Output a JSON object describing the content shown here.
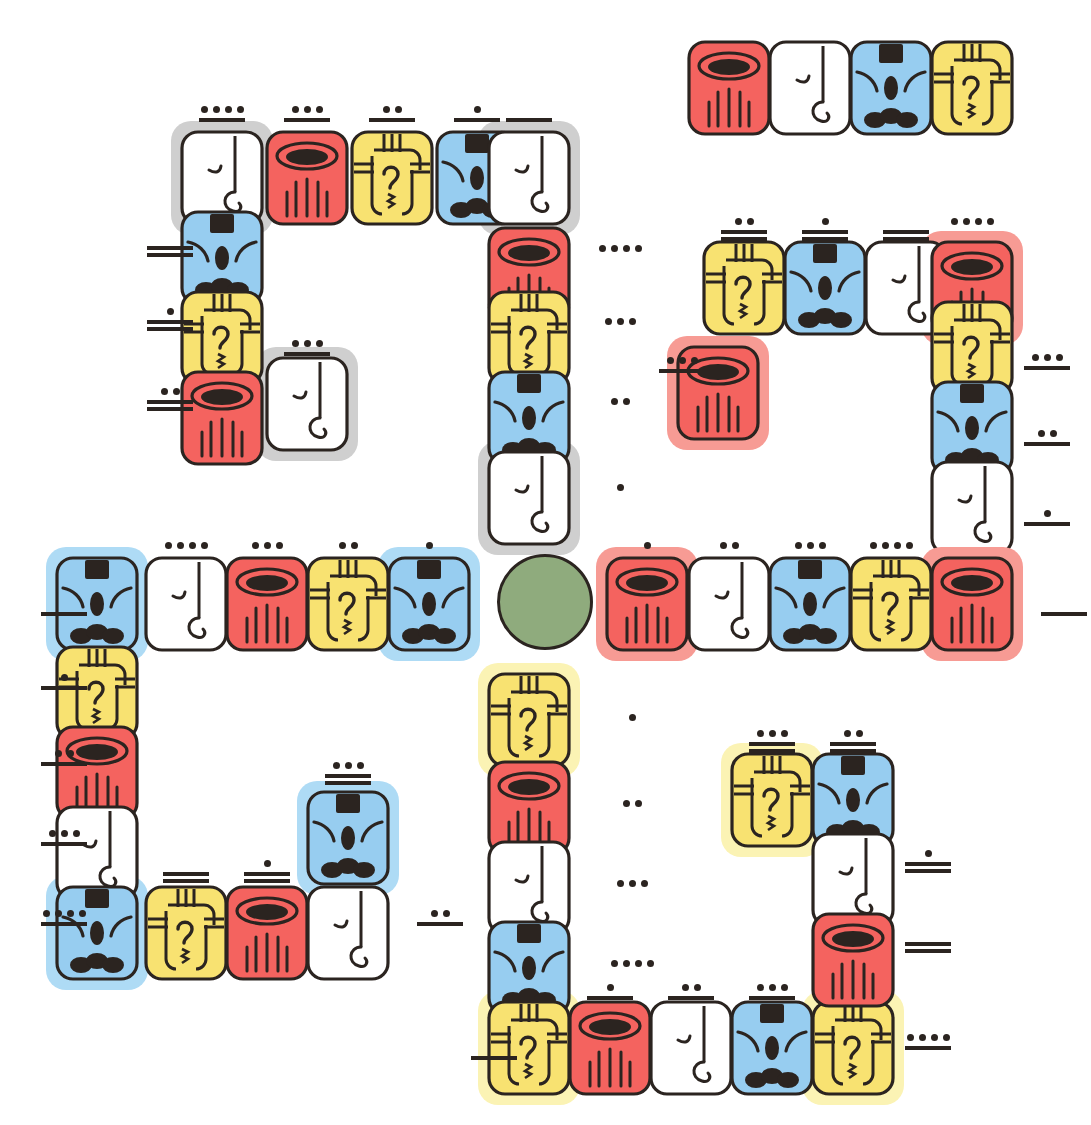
{
  "meta": {
    "canvas": {
      "width": 1067,
      "height": 1125
    },
    "background": "#ffffff"
  },
  "palette": {
    "red": "#f4635f",
    "red_halo": "#f79b94",
    "yellow": "#f8e271",
    "yellow_halo": "#fbf3b4",
    "blue": "#97cdf0",
    "blue_halo": "#aedbf5",
    "white": "#ffffff",
    "gray_halo": "#cfcfcf",
    "ink": "#2b2420",
    "green_circle": "#8fab7d"
  },
  "glyph_types": {
    "red": {
      "name": "red-bowl-glyph",
      "label": "red bowl with strokes"
    },
    "white": {
      "name": "white-hook-glyph",
      "label": "white hook"
    },
    "blue": {
      "name": "blue-face-glyph",
      "label": "blue face with dark crown"
    },
    "yellow": {
      "name": "yellow-spiral-glyph",
      "label": "yellow spiral scroll"
    }
  },
  "numerals": {
    "system": "maya-bar-and-dot",
    "dot_value": 1,
    "bar_value": 5
  },
  "separator": {
    "name": "green-circle-separator",
    "color": "#8fab7d",
    "cx": 545,
    "cy": 602,
    "r": 48
  },
  "groups": [
    {
      "id": "top-left-block",
      "name": "glyph-group-top-left",
      "cards": [
        {
          "id": "tl-r0c0",
          "type": "white",
          "x": 180,
          "y": 130,
          "halo": "gray"
        },
        {
          "id": "tl-r0c1",
          "type": "red",
          "x": 265,
          "y": 130,
          "halo": null
        },
        {
          "id": "tl-r0c2",
          "type": "yellow",
          "x": 350,
          "y": 130,
          "halo": null
        },
        {
          "id": "tl-r0c3",
          "type": "blue",
          "x": 435,
          "y": 130,
          "halo": null
        },
        {
          "id": "tl-r0c4",
          "type": "white",
          "x": 487,
          "y": 130,
          "halo": "gray"
        },
        {
          "id": "tl-c0r1",
          "type": "blue",
          "x": 180,
          "y": 210,
          "halo": null
        },
        {
          "id": "tl-c0r2",
          "type": "yellow",
          "x": 180,
          "y": 290,
          "halo": null
        },
        {
          "id": "tl-c0r3",
          "type": "red",
          "x": 180,
          "y": 370,
          "halo": null
        },
        {
          "id": "tl-r3c1",
          "type": "white",
          "x": 265,
          "y": 356,
          "halo": "gray"
        },
        {
          "id": "tl-c4r1",
          "type": "red",
          "x": 487,
          "y": 226,
          "halo": null
        },
        {
          "id": "tl-c4r2",
          "type": "yellow",
          "x": 487,
          "y": 290,
          "halo": null
        },
        {
          "id": "tl-c4r3",
          "type": "blue",
          "x": 487,
          "y": 370,
          "halo": null
        },
        {
          "id": "tl-c4r4",
          "type": "white",
          "x": 487,
          "y": 450,
          "halo": "gray"
        }
      ],
      "numerals": [
        {
          "id": "tl-n-top0",
          "dots": 4,
          "bars": 1,
          "x": 180,
          "y": 104,
          "anchor": "top"
        },
        {
          "id": "tl-n-top1",
          "dots": 3,
          "bars": 1,
          "x": 265,
          "y": 104,
          "anchor": "top"
        },
        {
          "id": "tl-n-top2",
          "dots": 2,
          "bars": 1,
          "x": 350,
          "y": 104,
          "anchor": "top"
        },
        {
          "id": "tl-n-top3",
          "dots": 1,
          "bars": 1,
          "x": 435,
          "y": 104,
          "anchor": "top"
        },
        {
          "id": "tl-n-top4",
          "dots": 0,
          "bars": 1,
          "x": 487,
          "y": 104,
          "anchor": "top"
        },
        {
          "id": "tl-n-left1",
          "dots": 0,
          "bars": 2,
          "x": 128,
          "y": 232,
          "anchor": "left"
        },
        {
          "id": "tl-n-left2",
          "dots": 1,
          "bars": 2,
          "x": 128,
          "y": 306,
          "anchor": "left"
        },
        {
          "id": "tl-n-left3",
          "dots": 2,
          "bars": 2,
          "x": 128,
          "y": 386,
          "anchor": "left"
        },
        {
          "id": "tl-n-in3",
          "dots": 3,
          "bars": 1,
          "x": 265,
          "y": 338,
          "anchor": "top"
        },
        {
          "id": "tl-n-right1",
          "dots": 4,
          "bars": 0,
          "x": 578,
          "y": 243,
          "anchor": "right"
        },
        {
          "id": "tl-n-right2",
          "dots": 3,
          "bars": 0,
          "x": 578,
          "y": 316,
          "anchor": "right"
        },
        {
          "id": "tl-n-right3",
          "dots": 2,
          "bars": 0,
          "x": 578,
          "y": 396,
          "anchor": "right"
        },
        {
          "id": "tl-n-right4",
          "dots": 1,
          "bars": 0,
          "x": 578,
          "y": 482,
          "anchor": "right"
        }
      ]
    },
    {
      "id": "top-right-strip",
      "name": "glyph-group-top-right-strip",
      "cards": [
        {
          "id": "trs-0",
          "type": "red",
          "x": 687,
          "y": 40,
          "halo": null
        },
        {
          "id": "trs-1",
          "type": "white",
          "x": 768,
          "y": 40,
          "halo": null
        },
        {
          "id": "trs-2",
          "type": "blue",
          "x": 849,
          "y": 40,
          "halo": null
        },
        {
          "id": "trs-3",
          "type": "yellow",
          "x": 930,
          "y": 40,
          "halo": null
        }
      ],
      "numerals": []
    },
    {
      "id": "mid-right-block",
      "name": "glyph-group-mid-right",
      "cards": [
        {
          "id": "mr-r0c0",
          "type": "yellow",
          "x": 702,
          "y": 240,
          "halo": null
        },
        {
          "id": "mr-r0c1",
          "type": "blue",
          "x": 783,
          "y": 240,
          "halo": null
        },
        {
          "id": "mr-r0c2",
          "type": "white",
          "x": 864,
          "y": 240,
          "halo": null
        },
        {
          "id": "mr-r0c3",
          "type": "red",
          "x": 930,
          "y": 240,
          "halo": "red"
        },
        {
          "id": "mr-c0r1",
          "type": "red",
          "x": 676,
          "y": 345,
          "halo": "red"
        },
        {
          "id": "mr-c3r1",
          "type": "yellow",
          "x": 930,
          "y": 300,
          "halo": null
        },
        {
          "id": "mr-c3r2",
          "type": "blue",
          "x": 930,
          "y": 380,
          "halo": null
        },
        {
          "id": "mr-c3r3",
          "type": "white",
          "x": 930,
          "y": 460,
          "halo": null
        }
      ],
      "numerals": [
        {
          "id": "mr-n-top0",
          "dots": 2,
          "bars": 2,
          "x": 702,
          "y": 216,
          "anchor": "top"
        },
        {
          "id": "mr-n-top1",
          "dots": 1,
          "bars": 2,
          "x": 783,
          "y": 216,
          "anchor": "top"
        },
        {
          "id": "mr-n-top2",
          "dots": 0,
          "bars": 2,
          "x": 864,
          "y": 216,
          "anchor": "top"
        },
        {
          "id": "mr-n-top3",
          "dots": 4,
          "bars": 0,
          "x": 930,
          "y": 216,
          "anchor": "top"
        },
        {
          "id": "mr-n-left1",
          "dots": 3,
          "bars": 1,
          "x": 640,
          "y": 355,
          "anchor": "left"
        },
        {
          "id": "mr-n-right1",
          "dots": 3,
          "bars": 1,
          "x": 1005,
          "y": 352,
          "anchor": "right"
        },
        {
          "id": "mr-n-right2",
          "dots": 2,
          "bars": 1,
          "x": 1005,
          "y": 428,
          "anchor": "right"
        },
        {
          "id": "mr-n-right3",
          "dots": 1,
          "bars": 1,
          "x": 1005,
          "y": 508,
          "anchor": "right"
        }
      ]
    },
    {
      "id": "mid-left-right-row",
      "name": "glyph-group-center-row",
      "cards": [
        {
          "id": "cl-0",
          "type": "blue",
          "x": 55,
          "y": 556,
          "halo": "blue"
        },
        {
          "id": "cl-1",
          "type": "white",
          "x": 144,
          "y": 556,
          "halo": null
        },
        {
          "id": "cl-2",
          "type": "red",
          "x": 225,
          "y": 556,
          "halo": null
        },
        {
          "id": "cl-3",
          "type": "yellow",
          "x": 306,
          "y": 556,
          "halo": null
        },
        {
          "id": "cl-4",
          "type": "blue",
          "x": 387,
          "y": 556,
          "halo": "blue"
        },
        {
          "id": "cr-0",
          "type": "red",
          "x": 605,
          "y": 556,
          "halo": "red"
        },
        {
          "id": "cr-1",
          "type": "white",
          "x": 687,
          "y": 556,
          "halo": null
        },
        {
          "id": "cr-2",
          "type": "blue",
          "x": 768,
          "y": 556,
          "halo": null
        },
        {
          "id": "cr-3",
          "type": "yellow",
          "x": 849,
          "y": 556,
          "halo": null
        },
        {
          "id": "cr-4",
          "type": "red",
          "x": 930,
          "y": 556,
          "halo": "red"
        }
      ],
      "numerals": [
        {
          "id": "cl-n-top1",
          "dots": 4,
          "bars": 0,
          "x": 144,
          "y": 540,
          "anchor": "top"
        },
        {
          "id": "cl-n-top2",
          "dots": 3,
          "bars": 0,
          "x": 225,
          "y": 540,
          "anchor": "top"
        },
        {
          "id": "cl-n-top3",
          "dots": 2,
          "bars": 0,
          "x": 306,
          "y": 540,
          "anchor": "top"
        },
        {
          "id": "cl-n-top4",
          "dots": 1,
          "bars": 0,
          "x": 387,
          "y": 540,
          "anchor": "top"
        },
        {
          "id": "cl-n-left0",
          "dots": 0,
          "bars": 1,
          "x": 22,
          "y": 598,
          "anchor": "left"
        },
        {
          "id": "cr-n-top0",
          "dots": 1,
          "bars": 0,
          "x": 605,
          "y": 540,
          "anchor": "top"
        },
        {
          "id": "cr-n-top1",
          "dots": 2,
          "bars": 0,
          "x": 687,
          "y": 540,
          "anchor": "top"
        },
        {
          "id": "cr-n-top2",
          "dots": 3,
          "bars": 0,
          "x": 768,
          "y": 540,
          "anchor": "top"
        },
        {
          "id": "cr-n-top3",
          "dots": 4,
          "bars": 0,
          "x": 849,
          "y": 540,
          "anchor": "top"
        },
        {
          "id": "cr-n-right4",
          "dots": 0,
          "bars": 1,
          "x": 1022,
          "y": 598,
          "anchor": "right"
        }
      ]
    },
    {
      "id": "bottom-left-block",
      "name": "glyph-group-bottom-left",
      "cards": [
        {
          "id": "bl-c0r1",
          "type": "yellow",
          "x": 55,
          "y": 645,
          "halo": null
        },
        {
          "id": "bl-c0r2",
          "type": "red",
          "x": 55,
          "y": 725,
          "halo": null
        },
        {
          "id": "bl-c0r3",
          "type": "white",
          "x": 55,
          "y": 805,
          "halo": null
        },
        {
          "id": "bl-c0r4",
          "type": "blue",
          "x": 55,
          "y": 885,
          "halo": "blue"
        },
        {
          "id": "bl-r4c1",
          "type": "yellow",
          "x": 144,
          "y": 885,
          "halo": null
        },
        {
          "id": "bl-r4c2",
          "type": "red",
          "x": 225,
          "y": 885,
          "halo": null
        },
        {
          "id": "bl-r4c3",
          "type": "white",
          "x": 306,
          "y": 885,
          "halo": null
        },
        {
          "id": "bl-r3c3",
          "type": "blue",
          "x": 306,
          "y": 790,
          "halo": "blue"
        }
      ],
      "numerals": [
        {
          "id": "bl-n-left1",
          "dots": 1,
          "bars": 1,
          "x": 22,
          "y": 672,
          "anchor": "left"
        },
        {
          "id": "bl-n-left2",
          "dots": 2,
          "bars": 1,
          "x": 22,
          "y": 748,
          "anchor": "left"
        },
        {
          "id": "bl-n-left3",
          "dots": 3,
          "bars": 1,
          "x": 22,
          "y": 828,
          "anchor": "left"
        },
        {
          "id": "bl-n-left4",
          "dots": 4,
          "bars": 1,
          "x": 22,
          "y": 908,
          "anchor": "left"
        },
        {
          "id": "bl-n-b1",
          "dots": 0,
          "bars": 2,
          "x": 144,
          "y": 858,
          "anchor": "top"
        },
        {
          "id": "bl-n-b2",
          "dots": 1,
          "bars": 2,
          "x": 225,
          "y": 858,
          "anchor": "top"
        },
        {
          "id": "bl-n-b3",
          "dots": 3,
          "bars": 2,
          "x": 306,
          "y": 760,
          "anchor": "top"
        },
        {
          "id": "bl-n-right4",
          "dots": 2,
          "bars": 1,
          "x": 398,
          "y": 908,
          "anchor": "right"
        }
      ]
    },
    {
      "id": "bottom-right-block",
      "name": "glyph-group-bottom-right",
      "cards": [
        {
          "id": "br-c0r0",
          "type": "yellow",
          "x": 487,
          "y": 672,
          "halo": "yellow"
        },
        {
          "id": "br-c0r1",
          "type": "red",
          "x": 487,
          "y": 760,
          "halo": null
        },
        {
          "id": "br-c0r2",
          "type": "white",
          "x": 487,
          "y": 840,
          "halo": null
        },
        {
          "id": "br-c0r3",
          "type": "blue",
          "x": 487,
          "y": 920,
          "halo": null
        },
        {
          "id": "br-r4c0",
          "type": "yellow",
          "x": 487,
          "y": 1000,
          "halo": "yellow"
        },
        {
          "id": "br-r4c1",
          "type": "red",
          "x": 568,
          "y": 1000,
          "halo": null
        },
        {
          "id": "br-r4c2",
          "type": "white",
          "x": 649,
          "y": 1000,
          "halo": null
        },
        {
          "id": "br-r4c3",
          "type": "blue",
          "x": 730,
          "y": 1000,
          "halo": null
        },
        {
          "id": "br-r4c4",
          "type": "yellow",
          "x": 811,
          "y": 1000,
          "halo": "yellow"
        },
        {
          "id": "br-c4r0",
          "type": "yellow",
          "x": 730,
          "y": 752,
          "halo": "yellow"
        },
        {
          "id": "br-c4r0b",
          "type": "blue",
          "x": 811,
          "y": 752,
          "halo": null
        },
        {
          "id": "br-c4r1",
          "type": "white",
          "x": 811,
          "y": 832,
          "halo": null
        },
        {
          "id": "br-c4r2",
          "type": "red",
          "x": 811,
          "y": 912,
          "halo": null
        }
      ],
      "numerals": [
        {
          "id": "br-n-in0",
          "dots": 1,
          "bars": 0,
          "x": 590,
          "y": 712,
          "anchor": "free"
        },
        {
          "id": "br-n-in1",
          "dots": 2,
          "bars": 0,
          "x": 590,
          "y": 798,
          "anchor": "free"
        },
        {
          "id": "br-n-in2",
          "dots": 3,
          "bars": 0,
          "x": 590,
          "y": 878,
          "anchor": "free"
        },
        {
          "id": "br-n-in3",
          "dots": 4,
          "bars": 0,
          "x": 590,
          "y": 958,
          "anchor": "free"
        },
        {
          "id": "br-n-b1",
          "dots": 1,
          "bars": 1,
          "x": 568,
          "y": 982,
          "anchor": "top"
        },
        {
          "id": "br-n-b2",
          "dots": 2,
          "bars": 1,
          "x": 649,
          "y": 982,
          "anchor": "top"
        },
        {
          "id": "br-n-b3",
          "dots": 3,
          "bars": 1,
          "x": 730,
          "y": 982,
          "anchor": "top"
        },
        {
          "id": "br-n-t0",
          "dots": 3,
          "bars": 2,
          "x": 730,
          "y": 728,
          "anchor": "top"
        },
        {
          "id": "br-n-t1",
          "dots": 2,
          "bars": 2,
          "x": 811,
          "y": 728,
          "anchor": "top"
        },
        {
          "id": "br-n-right1",
          "dots": 1,
          "bars": 2,
          "x": 886,
          "y": 848,
          "anchor": "right"
        },
        {
          "id": "br-n-right2",
          "dots": 0,
          "bars": 2,
          "x": 886,
          "y": 928,
          "anchor": "right"
        },
        {
          "id": "br-n-right3",
          "dots": 4,
          "bars": 1,
          "x": 886,
          "y": 1032,
          "anchor": "right"
        },
        {
          "id": "br-n-left4",
          "dots": 0,
          "bars": 1,
          "x": 452,
          "y": 1042,
          "anchor": "left"
        }
      ]
    }
  ]
}
